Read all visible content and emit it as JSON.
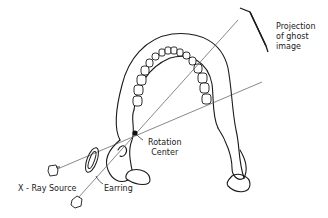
{
  "diagram": {
    "labels": {
      "projection": [
        "Projection",
        "of ghost",
        "image"
      ],
      "rotation_center": [
        "Rotation",
        "Center"
      ],
      "earring": "Earring",
      "xray_source": "X - Ray Source"
    },
    "colors": {
      "stroke": "#1a1a1a",
      "beam": "#555555",
      "background": "#ffffff"
    }
  }
}
